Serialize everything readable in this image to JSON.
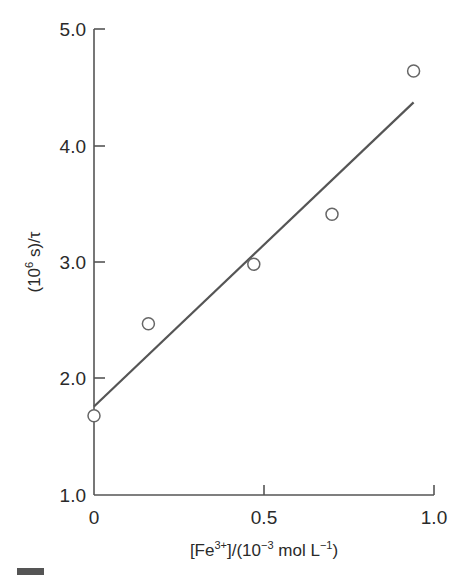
{
  "chart_data": {
    "type": "scatter",
    "title": "",
    "xlabel": "[Fe3+]/(10^-3 mol L^-1)",
    "ylabel": "(10^6 s)/τ",
    "xlim": [
      0,
      1.0
    ],
    "ylim": [
      1.0,
      5.0
    ],
    "x_ticks": [
      "0",
      "0.5",
      "1.0"
    ],
    "y_ticks": [
      "1.0",
      "2.0",
      "3.0",
      "4.0",
      "5.0"
    ],
    "grid": false,
    "legend": null,
    "series": [
      {
        "name": "measured",
        "marker": "open-circle",
        "x": [
          0.0,
          0.16,
          0.47,
          0.7,
          0.94
        ],
        "y": [
          1.68,
          2.47,
          2.98,
          3.41,
          4.64
        ]
      },
      {
        "name": "linear fit",
        "type": "line",
        "x": [
          0.0,
          0.94
        ],
        "y": [
          1.76,
          4.37
        ]
      }
    ]
  },
  "axes": {
    "x_label_parts": {
      "pre": "[Fe",
      "sup1": "3+",
      "mid": "]/(10",
      "sup2": "−3",
      "mid2": " mol L",
      "sup3": "−1",
      "post": ")"
    },
    "y_label_parts": {
      "pre": "(10",
      "sup": "6",
      "post": " s)/τ"
    },
    "x_tick_labels": [
      "0",
      "0.5",
      "1.0"
    ],
    "y_tick_labels": [
      "1.0",
      "2.0",
      "3.0",
      "4.0",
      "5.0"
    ]
  },
  "colors": {
    "axis": "#555555",
    "line": "#555555",
    "marker": "#666666",
    "text": "#2a2a2a"
  }
}
